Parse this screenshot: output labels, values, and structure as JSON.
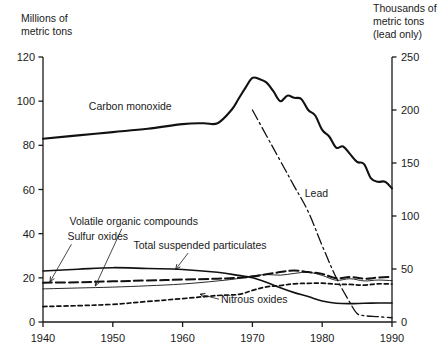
{
  "chart_data": {
    "type": "line",
    "title": "",
    "subtitle": "",
    "xlabel": "",
    "ylabel": "Millions of metric tons",
    "ylabel_right": "Thousands of metric tons (lead only)",
    "ylabel_lines": [
      "Millions of",
      "metric tons"
    ],
    "ylabel_right_lines": [
      "Thousands of",
      "metric tons",
      "(lead only)"
    ],
    "xlim": [
      1940,
      1990
    ],
    "ylim": [
      0,
      120
    ],
    "ylim_right": [
      0,
      250
    ],
    "xticks": [
      1940,
      1950,
      1960,
      1970,
      1980,
      1990
    ],
    "yticks": [
      0,
      20,
      40,
      60,
      80,
      100,
      120
    ],
    "yticks_right": [
      0,
      50,
      100,
      150,
      200,
      250
    ],
    "grid": false,
    "legend": "inline-annotations",
    "series": [
      {
        "name": "Carbon monoxide",
        "axis": "left",
        "style": "solid-thick",
        "label_x": 1952.5,
        "label_y": 96,
        "leader": false,
        "x": [
          1940,
          1945,
          1950,
          1955,
          1960,
          1963,
          1965,
          1967,
          1968,
          1969,
          1970,
          1971,
          1972,
          1973,
          1974,
          1975,
          1976,
          1977,
          1978,
          1979,
          1980,
          1981,
          1982,
          1983,
          1984,
          1985,
          1986,
          1987,
          1988,
          1989,
          1990
        ],
        "y": [
          83,
          84.5,
          86,
          87.5,
          89.6,
          90,
          90,
          96,
          101,
          106,
          110.5,
          110,
          108.5,
          104.5,
          100,
          102.5,
          101.5,
          101,
          96,
          93.5,
          87,
          84,
          79,
          79.5,
          76,
          72.5,
          71.5,
          65,
          63.5,
          63.5,
          60.5
        ]
      },
      {
        "name": "Lead",
        "axis": "right",
        "style": "dash-dot",
        "label_x": 1977.5,
        "label_y": 118,
        "leader": false,
        "x": [
          1970,
          1972,
          1974,
          1976,
          1978,
          1980,
          1982,
          1984,
          1985,
          1986,
          1988,
          1990
        ],
        "y": [
          200,
          176,
          152,
          128,
          104,
          72,
          42,
          18,
          8,
          6,
          5,
          4
        ]
      },
      {
        "name": "Total suspended particulates",
        "axis": "left",
        "style": "solid-medium",
        "label_x": 1962.5,
        "label_y": 33,
        "leader": true,
        "leader_x": 1959.0,
        "leader_y": 23.8,
        "x": [
          1940,
          1945,
          1950,
          1955,
          1960,
          1965,
          1968,
          1970,
          1972,
          1974,
          1976,
          1978,
          1980,
          1982,
          1984,
          1986,
          1988,
          1990
        ],
        "y": [
          23.1,
          23.9,
          24.6,
          24.2,
          23.8,
          22.5,
          21.1,
          20.0,
          18.0,
          15.5,
          13.3,
          11.5,
          9.5,
          8.5,
          8.3,
          8.5,
          8.6,
          8.6
        ]
      },
      {
        "name": "Sulfur oxides",
        "axis": "left",
        "style": "dashed-long",
        "label_x": 1943.5,
        "label_y": 37,
        "leader": true,
        "leader_x": 1941.0,
        "leader_y": 18.2,
        "x": [
          1940,
          1945,
          1950,
          1955,
          1960,
          1965,
          1968,
          1970,
          1972,
          1974,
          1976,
          1978,
          1980,
          1982,
          1984,
          1986,
          1988,
          1990
        ],
        "y": [
          17.8,
          18.0,
          18.4,
          18.8,
          19.2,
          19.6,
          20.0,
          20.6,
          21.6,
          22.6,
          23.3,
          22.6,
          21.8,
          19.8,
          20.4,
          19.6,
          20.1,
          20.4
        ]
      },
      {
        "name": "Volatile organic compounds",
        "axis": "left",
        "style": "solid-thin",
        "label_x": 1953.0,
        "label_y": 44,
        "leader": true,
        "leader_x": 1947.5,
        "leader_y": 16.3,
        "x": [
          1940,
          1945,
          1950,
          1955,
          1960,
          1965,
          1968,
          1970,
          1972,
          1974,
          1976,
          1978,
          1980,
          1982,
          1984,
          1986,
          1988,
          1990
        ],
        "y": [
          15.0,
          15.4,
          15.8,
          16.4,
          17.2,
          18.6,
          19.7,
          20.9,
          21.5,
          21.2,
          22.0,
          22.5,
          21.1,
          18.9,
          19.6,
          18.6,
          19.0,
          18.7
        ]
      },
      {
        "name": "Nitrous oxides",
        "axis": "left",
        "style": "dotted",
        "label_x": 1965.5,
        "label_y": 8.5,
        "leader": true,
        "leader_x": 1962.5,
        "leader_y": 12.6,
        "x": [
          1940,
          1945,
          1950,
          1955,
          1960,
          1965,
          1968,
          1970,
          1972,
          1974,
          1976,
          1978,
          1980,
          1982,
          1984,
          1986,
          1988,
          1990
        ],
        "y": [
          7.0,
          7.4,
          8.0,
          9.3,
          10.6,
          12.0,
          12.5,
          14.3,
          15.9,
          16.5,
          17.3,
          17.5,
          17.6,
          17.1,
          17.0,
          16.7,
          17.3,
          17.2
        ]
      }
    ]
  },
  "axes": {
    "left_title_line1": "Millions of",
    "left_title_line2": "metric tons",
    "right_title_line1": "Thousands of",
    "right_title_line2": "metric tons",
    "right_title_line3": "(lead only)"
  }
}
